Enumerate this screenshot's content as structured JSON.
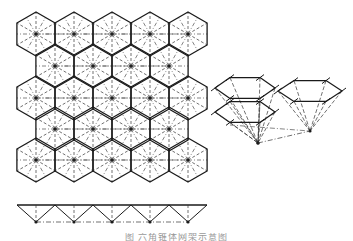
{
  "figure": {
    "type": "engineering-diagram",
    "caption": "图 六角锥体网架示意图",
    "colors": {
      "line": "#1a1a1a",
      "dash": "#333333",
      "background": "#ffffff"
    }
  },
  "plan": {
    "rows": 5,
    "hex_radius": 22,
    "row_centers_y": [
      34,
      66,
      98,
      129,
      160
    ],
    "even_row_centers_x": [
      36,
      74,
      112,
      150,
      188
    ],
    "odd_row_centers_x": [
      55,
      93,
      131,
      169
    ]
  },
  "section": {
    "top_chord": {
      "y": 205,
      "x1": 17,
      "x2": 207
    },
    "top_nodes_x": [
      17,
      55,
      93,
      131,
      169,
      207
    ],
    "bottom_nodes_x": [
      36,
      74,
      112,
      150,
      188
    ],
    "bottom_y": 222
  },
  "perspective": {
    "units": [
      {
        "name": "left-unit",
        "apex": [
          258,
          143
        ]
      },
      {
        "name": "right-unit",
        "apex": [
          310,
          131
        ]
      }
    ]
  }
}
